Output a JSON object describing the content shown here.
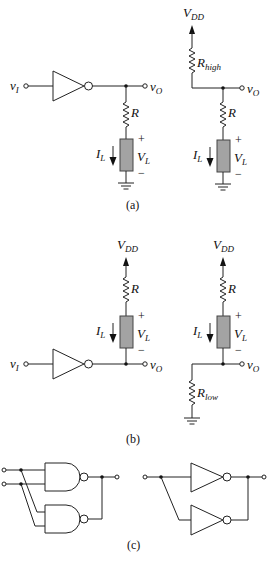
{
  "figure": {
    "panels": [
      {
        "id": "a",
        "caption": "(a)",
        "circuits": [
          {
            "name": "inverter-driving-load-to-ground",
            "input_label": "v",
            "input_sub": "I",
            "output_label": "v",
            "output_sub": "O",
            "resistor_label": "R",
            "current_label": "I",
            "current_sub": "L",
            "voltage_label": "V",
            "voltage_sub": "L",
            "plus": "+",
            "minus": "−"
          },
          {
            "name": "pullup-rhigh-load-to-ground",
            "supply_label": "V",
            "supply_sub": "DD",
            "pull_resistor_label": "R",
            "pull_resistor_sub": "high",
            "output_label": "v",
            "output_sub": "O",
            "resistor_label": "R",
            "current_label": "I",
            "current_sub": "L",
            "voltage_label": "V",
            "voltage_sub": "L",
            "plus": "+",
            "minus": "−"
          }
        ]
      },
      {
        "id": "b",
        "caption": "(b)",
        "circuits": [
          {
            "name": "inverter-sinking-load-from-vdd",
            "supply_label": "V",
            "supply_sub": "DD",
            "input_label": "v",
            "input_sub": "I",
            "output_label": "v",
            "output_sub": "O",
            "resistor_label": "R",
            "current_label": "I",
            "current_sub": "L",
            "voltage_label": "V",
            "voltage_sub": "L",
            "plus": "+",
            "minus": "−"
          },
          {
            "name": "pulldown-rlow-load-from-vdd",
            "supply_label": "V",
            "supply_sub": "DD",
            "pull_resistor_label": "R",
            "pull_resistor_sub": "low",
            "output_label": "v",
            "output_sub": "O",
            "resistor_label": "R",
            "current_label": "I",
            "current_sub": "L",
            "voltage_label": "V",
            "voltage_sub": "L",
            "plus": "+",
            "minus": "−"
          }
        ]
      },
      {
        "id": "c",
        "caption": "(c)",
        "circuits": [
          {
            "name": "parallel-nand-gates",
            "gate_type": "NAND",
            "count": 2
          },
          {
            "name": "parallel-inverters",
            "gate_type": "NOT",
            "count": 2
          }
        ]
      }
    ],
    "colors": {
      "wire": "#222222",
      "load_fill": "#a3a3a3",
      "background": "#ffffff"
    }
  }
}
